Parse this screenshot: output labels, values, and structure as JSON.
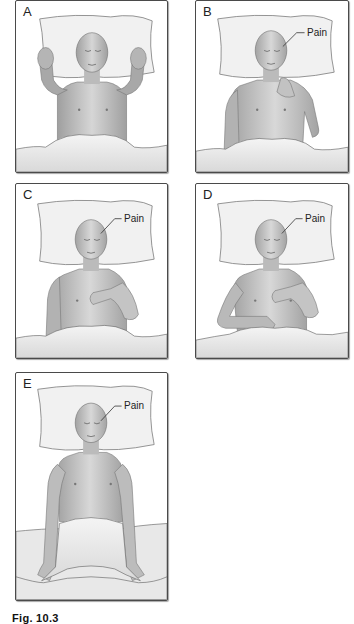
{
  "figure": {
    "panels": [
      {
        "id": "A",
        "letter": "A",
        "pain_label": null,
        "pose": "both hands raised beside head"
      },
      {
        "id": "B",
        "letter": "B",
        "pain_label": "Pain",
        "pose": "right hand at jaw/neck, left arm at side"
      },
      {
        "id": "C",
        "letter": "C",
        "pain_label": "Pain",
        "pose": "hand resting on chest"
      },
      {
        "id": "D",
        "letter": "D",
        "pain_label": "Pain",
        "pose": "hand on chest, other hand gripping blanket"
      },
      {
        "id": "E",
        "letter": "E",
        "pain_label": "Pain",
        "pose": "arms straight at sides, hands gripping blanket edge"
      }
    ],
    "caption": "Fig. 10.3"
  },
  "colors": {
    "background": "#ffffff",
    "frame": "#4a4a4a",
    "skin": "#c9c9c9",
    "skin_shade": "#9a9a9a",
    "pillow": "#f1f1f1",
    "blanket": "#e6e6e6",
    "text": "#222222"
  }
}
